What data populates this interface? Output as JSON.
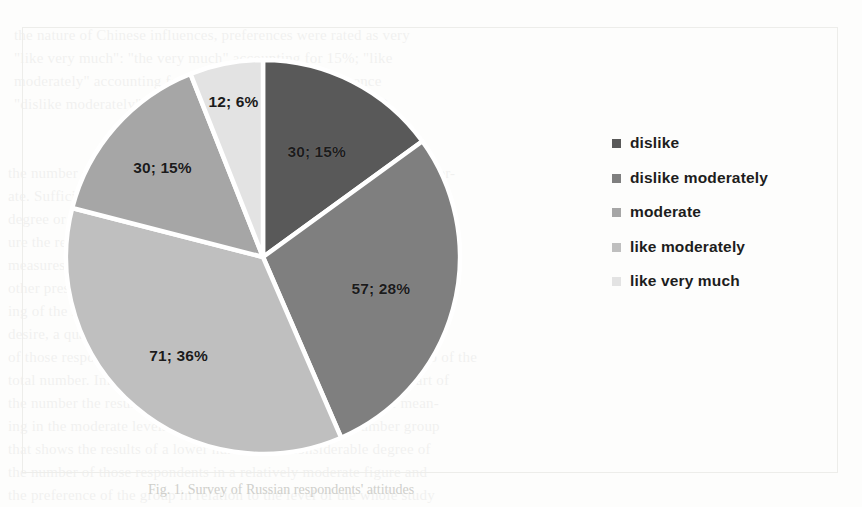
{
  "figure": {
    "caption": "Fig. 1. Survey of Russian respondents' attitudes"
  },
  "chart_data": {
    "type": "pie",
    "title": "",
    "legend_position": "right",
    "grid": false,
    "total": 200,
    "categories": [
      "dislike",
      "dislike moderately",
      "moderate",
      "like moderately",
      "like very much"
    ],
    "values": [
      30,
      57,
      30,
      71,
      12
    ],
    "percents": [
      15,
      28,
      15,
      36,
      6
    ],
    "data_labels": [
      "30; 15%",
      "57; 28%",
      "30; 15%",
      "71; 36%",
      "12; 6%"
    ],
    "slice_colors": [
      "#595959",
      "#7f7f7f",
      "#a6a6a6",
      "#bfbfbf",
      "#e3e3e3"
    ],
    "slices": [
      {
        "name": "dislike",
        "value": 30,
        "percent": 15,
        "label": "30; 15%",
        "color": "#595959"
      },
      {
        "name": "dislike moderately",
        "value": 57,
        "percent": 28,
        "label": "57; 28%",
        "color": "#7f7f7f"
      },
      {
        "name": "like moderately",
        "value": 71,
        "percent": 36,
        "label": "71; 36%",
        "color": "#bfbfbf"
      },
      {
        "name": "moderate",
        "value": 30,
        "percent": 15,
        "label": "30; 15%",
        "color": "#a6a6a6"
      },
      {
        "name": "like very much",
        "value": 12,
        "percent": 6,
        "label": "12; 6%",
        "color": "#e3e3e3"
      }
    ]
  },
  "legend": {
    "items": [
      {
        "label": "dislike",
        "color": "#595959"
      },
      {
        "label": "dislike moderately",
        "color": "#7f7f7f"
      },
      {
        "label": "moderate",
        "color": "#a6a6a6"
      },
      {
        "label": "like moderately",
        "color": "#bfbfbf"
      },
      {
        "label": "like very much",
        "color": "#e3e3e3"
      }
    ]
  },
  "background_text": {
    "lines": [
      {
        "x": 14,
        "y": 24,
        "text": "the nature of Chinese influences, preferences were rated as very"
      },
      {
        "x": 14,
        "y": 47,
        "text": "\"like very much\": \"the very much\" accounting for 15%; \"like"
      },
      {
        "x": 14,
        "y": 70,
        "text": "moderately\" accounting for 6% (54%) the lower preference"
      },
      {
        "x": 14,
        "y": 93,
        "text": "\"dislike moderately\" 28% as the respondents reported (28%)"
      },
      {
        "x": 8,
        "y": 162,
        "text": "the number of Chinese who are not ready to accept a standard of moder-"
      },
      {
        "x": 8,
        "y": 185,
        "text": "ate. Sufficiently a great number of respondents are of a very low value"
      },
      {
        "x": 8,
        "y": 208,
        "text": "degree or the level of that. And of the direction in terms of the lower fig-"
      },
      {
        "x": 8,
        "y": 231,
        "text": "ure the results of this study reveal that a relatively very small number"
      },
      {
        "x": 8,
        "y": 254,
        "text": "measures known in the respondents as a preference that indicates the"
      },
      {
        "x": 8,
        "y": 277,
        "text": "other prestige status.  A proportion of the respondents reported a rat-"
      },
      {
        "x": 8,
        "y": 300,
        "text": "ing of the nature. One of the surveyed that reveals the willingness of a"
      },
      {
        "x": 8,
        "y": 323,
        "text": "desire, a quarter of all. In the lesser case this group, a number so used"
      },
      {
        "x": 8,
        "y": 346,
        "text": "of those respondents. Aspects of a degree. In the respondents are also of the"
      },
      {
        "x": 8,
        "y": 369,
        "text": "total number. Influence, in the majority of that, a relatively high part of"
      },
      {
        "x": 8,
        "y": 392,
        "text": "the number the result of the preference, to be of a considerable mean-"
      },
      {
        "x": 8,
        "y": 415,
        "text": "ing in the moderate levels of the whole of the surveyed number group"
      },
      {
        "x": 8,
        "y": 438,
        "text": "that shows the results of a lower number of a considerable degree of"
      },
      {
        "x": 8,
        "y": 461,
        "text": "the number of those respondents in a relatively moderate figure and"
      },
      {
        "x": 8,
        "y": 484,
        "text": "the preference of the group in relation to the level of the whole study"
      }
    ]
  }
}
